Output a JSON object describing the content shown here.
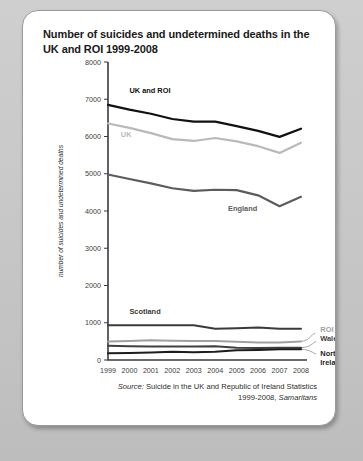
{
  "page": {
    "background_color": "#c9c9c9",
    "card_color": "#ffffff"
  },
  "title": "Number of suicides and undetermined deaths in the UK and ROI 1999-2008",
  "source": {
    "prefix": "Source:",
    "text": " Suicide in the UK and Republic of Ireland Statistics 1999-2008, ",
    "publisher": "Samaritans"
  },
  "chart_data": {
    "type": "line",
    "title": "Number of suicides and undetermined deaths in the UK and ROI 1999-2008",
    "xlabel": "",
    "ylabel": "number of suicides and undetermined deaths",
    "x": [
      1999,
      2000,
      2001,
      2002,
      2003,
      2004,
      2005,
      2006,
      2007,
      2008
    ],
    "xtick_labels": [
      "1999",
      "2000",
      "2001",
      "2002",
      "2003",
      "2004",
      "2005",
      "2006",
      "2007",
      "2008"
    ],
    "ylim": [
      0,
      8000
    ],
    "yticks": [
      0,
      1000,
      2000,
      3000,
      4000,
      5000,
      6000,
      7000,
      8000
    ],
    "ytick_labels": [
      "0",
      "1000",
      "2000",
      "3000",
      "4000",
      "5000",
      "6000",
      "7000",
      "8000"
    ],
    "grid": false,
    "legend": "inline-annotations",
    "series": [
      {
        "name": "UK and ROI",
        "color": "#111111",
        "width": 2.2,
        "label_x": 2000.0,
        "label_y": 7180,
        "label_anchor": "start",
        "values": [
          6850,
          6720,
          6610,
          6470,
          6400,
          6400,
          6280,
          6150,
          5990,
          6210
        ]
      },
      {
        "name": "UK",
        "color": "#b9b9b9",
        "width": 2.2,
        "label_x": 1999.6,
        "label_y": 5980,
        "label_anchor": "start",
        "values": [
          6350,
          6230,
          6090,
          5930,
          5880,
          5960,
          5870,
          5740,
          5560,
          5830
        ]
      },
      {
        "name": "England",
        "color": "#5c5c5c",
        "width": 2.2,
        "label_x": 2004.6,
        "label_y": 4010,
        "label_anchor": "start",
        "values": [
          4980,
          4860,
          4740,
          4610,
          4540,
          4570,
          4560,
          4420,
          4130,
          4380
        ]
      },
      {
        "name": "Scotland",
        "color": "#3a3a3a",
        "width": 2.0,
        "label_x": 2000.0,
        "label_y": 1230,
        "label_anchor": "start",
        "values": [
          930,
          930,
          930,
          930,
          930,
          840,
          850,
          870,
          840,
          840
        ]
      },
      {
        "name": "ROI",
        "color": "#a0a0a0",
        "width": 2.0,
        "label_x": 2008.9,
        "label_y": 740,
        "label_anchor": "start",
        "values": [
          500,
          510,
          530,
          520,
          510,
          510,
          490,
          470,
          470,
          500
        ]
      },
      {
        "name": "Wales",
        "color": "#404040",
        "width": 2.0,
        "label_x": 2008.9,
        "label_y": 520,
        "label_anchor": "start",
        "values": [
          380,
          370,
          360,
          360,
          360,
          370,
          330,
          320,
          330,
          330
        ]
      },
      {
        "name": "Northern Ireland",
        "color": "#1d1d1d",
        "width": 2.0,
        "label_x": 2008.9,
        "label_y": 120,
        "label_anchor": "start",
        "values": [
          180,
          190,
          200,
          220,
          210,
          220,
          260,
          270,
          290,
          290
        ]
      }
    ]
  }
}
